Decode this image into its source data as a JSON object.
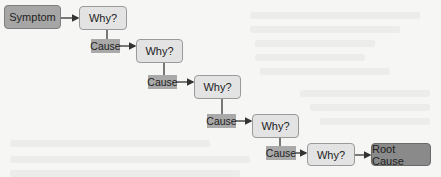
{
  "diagram": {
    "start": {
      "label": "Symptom",
      "color": "#a6a6a6"
    },
    "why_label": "Why?",
    "cause_label": "Cause",
    "steps": [
      {
        "why": "Why?",
        "cause": "Cause"
      },
      {
        "why": "Why?",
        "cause": "Cause"
      },
      {
        "why": "Why?",
        "cause": "Cause"
      },
      {
        "why": "Why?",
        "cause": "Cause"
      },
      {
        "why": "Why?"
      }
    ],
    "end": {
      "label": "Root Cause",
      "color": "#8a8a8a"
    },
    "colors": {
      "why_fill": "#e3e3e3",
      "cause_fill": "#a9a9a9",
      "edge": "#333333"
    }
  }
}
